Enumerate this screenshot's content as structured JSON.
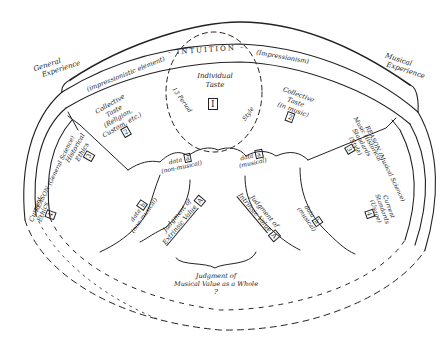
{
  "diagram": {
    "outer_labels": {
      "general_experience": [
        "General",
        "Experience"
      ],
      "musical_experience": [
        "Musical",
        "Experience"
      ]
    },
    "intuition_band": {
      "left": "(impressionistic element)",
      "center": "- INTUITION -",
      "right": "(Impressionism)"
    },
    "reason_band": {
      "left": "REASON (General Science)",
      "right": "REASON (Musical Science)"
    },
    "center_circle": {
      "title": [
        "Individual",
        "Taste"
      ],
      "box": "I",
      "left_arc": "13 Period",
      "right_arc": "Style"
    },
    "regions": [
      {
        "id": "collective-taste-left",
        "lines": [
          "Collective",
          "Taste",
          "(Religion,",
          "Custom, etc.)"
        ],
        "box": "2"
      },
      {
        "id": "collective-taste-right",
        "lines": [
          "Collective",
          "Taste",
          "(in music)"
        ],
        "box": "2"
      },
      {
        "id": "historical-ethics",
        "lines": [
          "Historical",
          "Ethics"
        ],
        "box": "3"
      },
      {
        "id": "music-historical-standards",
        "lines": [
          "Music Historical",
          "Standards",
          "(Style)"
        ],
        "box": "3"
      },
      {
        "id": "current-ethics",
        "lines": [
          "Current",
          "Ethics"
        ],
        "box": "4"
      },
      {
        "id": "current-standards",
        "lines": [
          "Current",
          "Standards",
          "(Usage)"
        ],
        "box": "4"
      },
      {
        "id": "data-a-nonmusical",
        "lines": [
          "data",
          "(non-musical)"
        ],
        "box": "a"
      },
      {
        "id": "data-a-musical",
        "lines": [
          "data",
          "(musical)"
        ],
        "box": "a"
      },
      {
        "id": "data-b-nonmusical",
        "lines": [
          "data",
          "(non-musical)"
        ],
        "box": "b"
      },
      {
        "id": "data-b-musical",
        "lines": [
          "data",
          "(musical)"
        ],
        "box": "b"
      },
      {
        "id": "judgment-extrinsic",
        "lines": [
          "Judgment of",
          "Extrinsic Value"
        ],
        "box": "A"
      },
      {
        "id": "judgment-intrinsic",
        "lines": [
          "Judgment of",
          "Intrinsic Value"
        ],
        "box": "A"
      }
    ],
    "bottom": {
      "lines": [
        "Judgment of",
        "Musical Value as a Whole"
      ],
      "question": "?"
    }
  }
}
